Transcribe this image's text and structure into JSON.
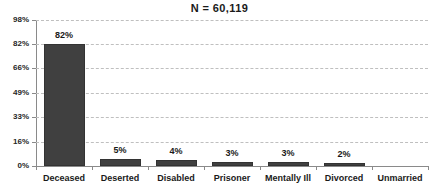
{
  "chart_data": {
    "type": "bar",
    "title": "N = 60,119",
    "xlabel": "",
    "ylabel": "",
    "categories": [
      "Deceased",
      "Deserted",
      "Disabled",
      "Prisoner",
      "Mentally Ill",
      "Divorced",
      "Unmarried"
    ],
    "values": [
      82,
      5,
      4,
      3,
      3,
      2,
      0
    ],
    "value_labels": [
      "82%",
      "5%",
      "4%",
      "3%",
      "3%",
      "2%",
      ""
    ],
    "ylim": [
      0,
      98
    ],
    "ytick_values": [
      0,
      16,
      33,
      49,
      66,
      82,
      98
    ],
    "ytick_labels": [
      "0%",
      "16%",
      "33%",
      "49%",
      "66%",
      "82%",
      "98%"
    ],
    "grid": true,
    "grid_axis": "y",
    "grid_style": "dashed",
    "legend": false,
    "bar_color": "#404040",
    "bar_edge_color": "#333333",
    "grid_color": "#bfbfbf",
    "axis_color": "#8a8a8a",
    "text_color": "#1a1a1a",
    "background": "#ffffff"
  }
}
